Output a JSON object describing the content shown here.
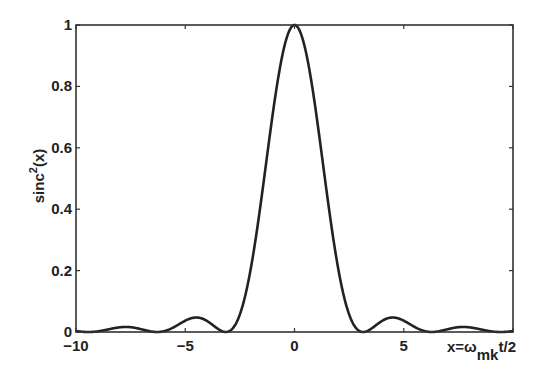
{
  "chart_data": {
    "type": "line",
    "title": "",
    "xlabel": "x=ω_mk t/2",
    "xlabel_parts": {
      "main": "x=ω",
      "sub": "mk",
      "tail": "t/2"
    },
    "ylabel": "sinc²(x)",
    "ylabel_parts": {
      "main": "sinc",
      "sup": "2",
      "tail": "(x)"
    },
    "xlim": [
      -10,
      10
    ],
    "ylim": [
      0,
      1
    ],
    "xticks": [
      -10,
      -5,
      0,
      5
    ],
    "xtick_labels": [
      "−10",
      "−5",
      "0",
      "5"
    ],
    "yticks": [
      0,
      0.2,
      0.4,
      0.6,
      0.8,
      1
    ],
    "ytick_labels": [
      "0",
      "0.2",
      "0.4",
      "0.6",
      "0.8",
      "1"
    ],
    "grid": false,
    "legend": null,
    "box": true,
    "series": [
      {
        "name": "sinc^2(x)",
        "function": "(sin(x)/x)^2",
        "color": "#222222",
        "x": [
          -10,
          -9.42,
          -8.5,
          -7.73,
          -7,
          -6.28,
          -5.5,
          -4.49,
          -3.8,
          -3.14,
          -2.5,
          -2,
          -1.5,
          -1,
          -0.5,
          0,
          0.5,
          1,
          1.5,
          2,
          2.5,
          3.14,
          3.8,
          4.49,
          5.5,
          6.28,
          7,
          7.73,
          8.5,
          9.42,
          10
        ],
        "values": [
          0.003,
          0.0,
          0.009,
          0.016,
          0.009,
          0.0,
          0.017,
          0.047,
          0.026,
          0.0,
          0.057,
          0.207,
          0.441,
          0.708,
          0.919,
          1.0,
          0.919,
          0.708,
          0.441,
          0.207,
          0.057,
          0.0,
          0.026,
          0.047,
          0.017,
          0.0,
          0.009,
          0.016,
          0.009,
          0.0,
          0.003
        ]
      }
    ]
  }
}
